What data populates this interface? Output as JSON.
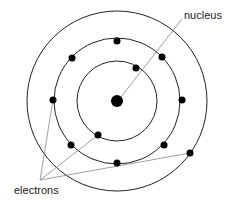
{
  "diagram": {
    "labels": {
      "nucleus": "nucleus",
      "electrons": "electrons"
    },
    "center": {
      "x": 117,
      "y": 101
    },
    "nucleus_radius": 6,
    "shells": [
      {
        "name": "inner-shell",
        "radius": 40
      },
      {
        "name": "middle-shell",
        "radius": 63
      },
      {
        "name": "outer-shell",
        "radius": 90
      }
    ],
    "electrons": [
      {
        "shell": "inner-shell",
        "x": 136,
        "y": 68
      },
      {
        "shell": "inner-shell",
        "x": 98,
        "y": 135
      },
      {
        "shell": "middle-shell",
        "x": 117,
        "y": 41
      },
      {
        "shell": "middle-shell",
        "x": 72,
        "y": 58
      },
      {
        "shell": "middle-shell",
        "x": 162,
        "y": 57
      },
      {
        "shell": "middle-shell",
        "x": 53,
        "y": 100
      },
      {
        "shell": "middle-shell",
        "x": 182,
        "y": 100
      },
      {
        "shell": "middle-shell",
        "x": 71,
        "y": 145
      },
      {
        "shell": "middle-shell",
        "x": 164,
        "y": 145
      },
      {
        "shell": "middle-shell",
        "x": 117,
        "y": 163
      },
      {
        "shell": "outer-shell",
        "x": 190,
        "y": 153
      }
    ],
    "colors": {
      "stroke": "#222222",
      "leader": "#888888",
      "fill": "#000000"
    }
  }
}
